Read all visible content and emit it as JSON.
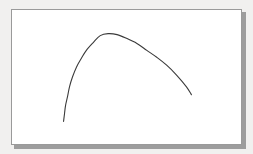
{
  "figure": {
    "background_color": "#f1f0ef",
    "panel_color": "#ffffff",
    "frame_border_color": "#9a9a9a",
    "shadow_color": "#8e8e8e",
    "frame": {
      "x": 11,
      "y": 9,
      "width": 231,
      "height": 136
    }
  },
  "chart_data": {
    "type": "line",
    "title": "",
    "subtitle": "",
    "xlabel": "",
    "ylabel": "",
    "grid": false,
    "legend": null,
    "axes_visible": false,
    "tick_labels_x": [],
    "tick_labels_y": [],
    "xlim": [
      0,
      231
    ],
    "ylim": [
      0,
      136
    ],
    "series": [
      {
        "name": "curve",
        "color": "#3a3a3a",
        "line_width": 1.1,
        "style": "solid",
        "x": [
          52,
          53,
          54,
          56,
          58,
          61,
          65,
          70,
          75,
          82,
          89,
          97,
          106,
          116,
          126,
          136,
          146,
          156,
          166,
          176,
          181
        ],
        "y": [
          113,
          105,
          97,
          88,
          78,
          68,
          58,
          49,
          41,
          33,
          26,
          24,
          25,
          29,
          34,
          41,
          48,
          56,
          66,
          78,
          86
        ]
      }
    ],
    "annotations": [],
    "peak_point": {
      "x": 93,
      "y": 33
    },
    "left_tail_end": {
      "x": 63,
      "y": 122
    },
    "right_tail_end": {
      "x": 192,
      "y": 105
    }
  }
}
